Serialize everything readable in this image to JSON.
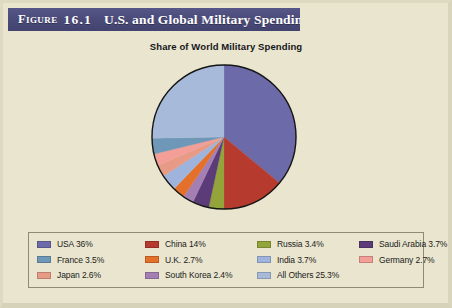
{
  "figure": {
    "label": "Figure",
    "number": "16.1",
    "title": "U.S. and Global Military Spending",
    "title_bar_color": "#4c4c7c",
    "title_text_color": "#ffffff",
    "page_background": "#e9e5ce"
  },
  "chart_data": {
    "type": "pie",
    "title": "Share of World Military Spending",
    "subtitle": "",
    "xlabel": "",
    "ylabel": "",
    "legend_position": "bottom",
    "grid": false,
    "units": "percent of world military spending",
    "start_angle_clock": "12:00",
    "direction": "clockwise",
    "categories": [
      "USA",
      "China",
      "Russia",
      "Saudi Arabia",
      "South Korea",
      "U.K.",
      "India",
      "Japan",
      "Germany",
      "France",
      "All Others"
    ],
    "values": [
      36,
      14,
      3.4,
      3.7,
      2.4,
      2.7,
      3.7,
      2.6,
      2.7,
      3.5,
      25.3
    ],
    "colors": [
      "#6c6aa8",
      "#b63a2e",
      "#93a53a",
      "#5c3c78",
      "#a47fb4",
      "#e4702a",
      "#9fb4dc",
      "#e79a86",
      "#f39e97",
      "#6e97b8",
      "#a8bada"
    ],
    "slices": [
      {
        "name": "USA",
        "value": 36,
        "label": "USA 36%",
        "color": "#6c6aa8"
      },
      {
        "name": "China",
        "value": 14,
        "label": "China 14%",
        "color": "#b63a2e"
      },
      {
        "name": "Russia",
        "value": 3.4,
        "label": "Russia 3.4%",
        "color": "#93a53a"
      },
      {
        "name": "Saudi Arabia",
        "value": 3.7,
        "label": "Saudi Arabia 3.7%",
        "color": "#5c3c78"
      },
      {
        "name": "South Korea",
        "value": 2.4,
        "label": "South Korea 2.4%",
        "color": "#a47fb4"
      },
      {
        "name": "U.K.",
        "value": 2.7,
        "label": "U.K. 2.7%",
        "color": "#e4702a"
      },
      {
        "name": "India",
        "value": 3.7,
        "label": "India 3.7%",
        "color": "#9fb4dc"
      },
      {
        "name": "Japan",
        "value": 2.6,
        "label": "Japan 2.6%",
        "color": "#e79a86"
      },
      {
        "name": "Germany",
        "value": 2.7,
        "label": "Germany 2.7%",
        "color": "#f39e97"
      },
      {
        "name": "France",
        "value": 3.5,
        "label": "France 3.5%",
        "color": "#6e97b8"
      },
      {
        "name": "All Others",
        "value": 25.3,
        "label": "All Others 25.3%",
        "color": "#a8bada"
      }
    ]
  },
  "legend": {
    "columns": [
      [
        {
          "label": "USA 36%",
          "color": "#6c6aa8"
        },
        {
          "label": "France 3.5%",
          "color": "#6e97b8"
        },
        {
          "label": "Japan 2.6%",
          "color": "#e79a86"
        }
      ],
      [
        {
          "label": "China 14%",
          "color": "#b63a2e"
        },
        {
          "label": "U.K. 2.7%",
          "color": "#e4702a"
        },
        {
          "label": "South Korea 2.4%",
          "color": "#a47fb4"
        }
      ],
      [
        {
          "label": "Russia 3.4%",
          "color": "#93a53a"
        },
        {
          "label": "India 3.7%",
          "color": "#9fb4dc"
        },
        {
          "label": "All Others 25.3%",
          "color": "#a8bada"
        }
      ],
      [
        {
          "label": "Saudi Arabia 3.7%",
          "color": "#5c3c78"
        },
        {
          "label": "Germany 2.7%",
          "color": "#f39e97"
        }
      ]
    ]
  }
}
